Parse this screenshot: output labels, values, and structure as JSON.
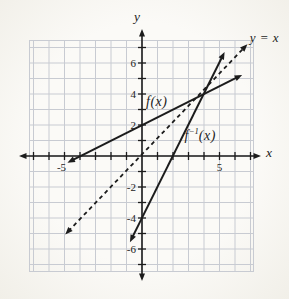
{
  "chart_data": {
    "type": "line",
    "title": "",
    "axes": {
      "x_label": "x",
      "y_label": "y",
      "x_range": [
        -7,
        7
      ],
      "y_range": [
        -7,
        7
      ],
      "tick_step": 1,
      "grid": true,
      "x_tick_labels": [
        {
          "value": -5,
          "text": "-5"
        },
        {
          "value": 5,
          "text": "5"
        }
      ],
      "y_tick_labels": [
        {
          "value": 6,
          "text": "6"
        },
        {
          "value": 4,
          "text": "4"
        },
        {
          "value": 2,
          "text": "2"
        },
        {
          "value": -2,
          "text": "-2"
        },
        {
          "value": -4,
          "text": "-4"
        },
        {
          "value": -6,
          "text": "-6"
        }
      ]
    },
    "series": [
      {
        "id": "f",
        "label": "f(x)",
        "style": "solid",
        "arrows": "both",
        "points": [
          [
            -4.55,
            -0.3
          ],
          [
            6.2,
            5.1
          ]
        ],
        "label_pos": [
          0.95,
          3.5
        ]
      },
      {
        "id": "f_inverse",
        "label": "f⁻¹(x)",
        "label_parts": {
          "base": "f",
          "sup": "−1",
          "rest": "(x)"
        },
        "style": "solid",
        "arrows": "both",
        "points": [
          [
            -0.65,
            -5.3
          ],
          [
            5.2,
            6.45
          ]
        ],
        "label_pos": [
          3.75,
          1.35
        ]
      },
      {
        "id": "identity",
        "label": "y = x",
        "style": "dashed",
        "arrows": "both",
        "points": [
          [
            -4.75,
            -4.85
          ],
          [
            6.6,
            7.0
          ]
        ],
        "label_pos": [
          7.9,
          7.6
        ]
      }
    ],
    "colors": {
      "line": "#1c1c1c",
      "axis": "#1c1c1c",
      "grid": "#c8cbd2",
      "background": "#f7f5f0"
    }
  }
}
